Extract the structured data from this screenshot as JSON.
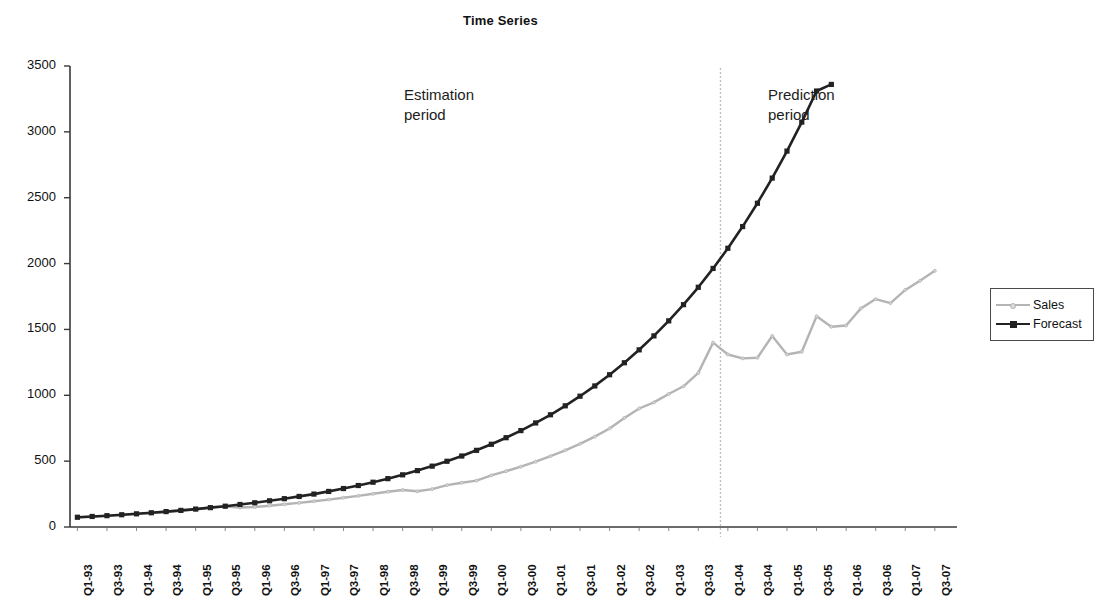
{
  "chart_data": {
    "type": "line",
    "title": "Time Series",
    "xlabel": "",
    "ylabel": "",
    "ylim": [
      0,
      3500
    ],
    "y_ticks": [
      0,
      500,
      1000,
      1500,
      2000,
      2500,
      3000,
      3500
    ],
    "grid": false,
    "legend_position": "right",
    "x": [
      "Q1-93",
      "Q2-93",
      "Q3-93",
      "Q4-93",
      "Q1-94",
      "Q2-94",
      "Q3-94",
      "Q4-94",
      "Q1-95",
      "Q2-95",
      "Q3-95",
      "Q4-95",
      "Q1-96",
      "Q2-96",
      "Q3-96",
      "Q4-96",
      "Q1-97",
      "Q2-97",
      "Q3-97",
      "Q4-97",
      "Q1-98",
      "Q2-98",
      "Q3-98",
      "Q4-98",
      "Q1-99",
      "Q2-99",
      "Q3-99",
      "Q4-99",
      "Q1-00",
      "Q2-00",
      "Q3-00",
      "Q4-00",
      "Q1-01",
      "Q2-01",
      "Q3-01",
      "Q4-01",
      "Q1-02",
      "Q2-02",
      "Q3-02",
      "Q4-02",
      "Q1-03",
      "Q2-03",
      "Q3-03",
      "Q4-03",
      "Q1-04",
      "Q2-04",
      "Q3-04",
      "Q4-04",
      "Q1-05",
      "Q2-05",
      "Q3-05",
      "Q4-05",
      "Q1-06",
      "Q2-06",
      "Q3-06",
      "Q4-06",
      "Q1-07",
      "Q2-07",
      "Q3-07",
      "Q4-07"
    ],
    "x_tick_labels": [
      "Q1-93",
      "Q3-93",
      "Q1-94",
      "Q3-94",
      "Q1-95",
      "Q3-95",
      "Q1-96",
      "Q3-96",
      "Q1-97",
      "Q3-97",
      "Q1-98",
      "Q3-98",
      "Q1-99",
      "Q3-99",
      "Q1-00",
      "Q3-00",
      "Q1-01",
      "Q3-01",
      "Q1-02",
      "Q3-02",
      "Q1-03",
      "Q3-03",
      "Q1-04",
      "Q3-04",
      "Q1-05",
      "Q3-05",
      "Q1-06",
      "Q3-06",
      "Q1-07",
      "Q3-07"
    ],
    "series": [
      {
        "name": "Sales",
        "color": "#b4b4b4",
        "marker": "small-dot",
        "values": [
          72,
          78,
          84,
          90,
          98,
          106,
          114,
          122,
          133,
          150,
          155,
          148,
          152,
          162,
          172,
          183,
          196,
          208,
          222,
          236,
          252,
          268,
          281,
          272,
          288,
          318,
          336,
          352,
          392,
          424,
          458,
          496,
          538,
          582,
          632,
          686,
          748,
          828,
          900,
          946,
          1010,
          1068,
          1170,
          1400,
          1310,
          1280,
          1285,
          1450,
          1310,
          1330,
          1600,
          1520,
          1530,
          1660,
          1730,
          1700,
          1800,
          1870,
          1945,
          null
        ]
      },
      {
        "name": "Forecast",
        "color": "#222222",
        "marker": "square",
        "values": [
          74,
          80,
          86,
          93,
          100,
          108,
          117,
          126,
          136,
          147,
          158,
          171,
          184,
          199,
          215,
          232,
          250,
          270,
          292,
          315,
          340,
          367,
          396,
          428,
          462,
          499,
          539,
          582,
          628,
          678,
          732,
          790,
          852,
          920,
          993,
          1071,
          1156,
          1247,
          1345,
          1451,
          1565,
          1688,
          1820,
          1963,
          2116,
          2281,
          2458,
          2649,
          2854,
          3074,
          3310,
          3360,
          null,
          null,
          null,
          null,
          null,
          null,
          null,
          null
        ]
      }
    ],
    "annotations": [
      {
        "name": "estimation-period",
        "text": "Estimation\nperiod",
        "x_position": "Q1-97"
      },
      {
        "name": "prediction-period",
        "text": "Prediction\nperiod",
        "x_position": "Q1-04"
      },
      {
        "name": "period-divider",
        "type": "vertical-line",
        "style": "dashed",
        "color": "#bfbfbf",
        "at_x": "Q4-03"
      }
    ]
  },
  "legend": {
    "items": [
      {
        "label": "Sales",
        "color": "#b4b4b4",
        "marker": "small-dot"
      },
      {
        "label": "Forecast",
        "color": "#222222",
        "marker": "square"
      }
    ]
  }
}
